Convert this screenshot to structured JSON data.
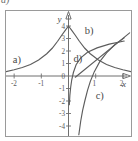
{
  "figure": {
    "corner_tag": "d)",
    "axis_labels": {
      "x": "x",
      "y": "y"
    },
    "x_ticks": [
      {
        "value": -2,
        "label": "-2"
      },
      {
        "value": -1,
        "label": "-1"
      },
      {
        "value": 1,
        "label": "1"
      },
      {
        "value": 2,
        "label": "2"
      }
    ],
    "y_ticks": [
      {
        "value": 4,
        "label": "4"
      },
      {
        "value": 3,
        "label": "3"
      },
      {
        "value": 2,
        "label": "2"
      },
      {
        "value": 1,
        "label": "1"
      },
      {
        "value": 0,
        "label": "0"
      },
      {
        "value": -1,
        "label": "-1"
      },
      {
        "value": -2,
        "label": "-2"
      },
      {
        "value": -3,
        "label": "-3"
      },
      {
        "value": -4,
        "label": "-4"
      }
    ],
    "curve_labels": [
      {
        "id": "a",
        "text": "a)"
      },
      {
        "id": "b",
        "text": "b)"
      },
      {
        "id": "c",
        "text": "c)"
      },
      {
        "id": "d",
        "text": "d)"
      }
    ]
  },
  "chart_data": {
    "type": "line",
    "title": "",
    "xlabel": "x",
    "ylabel": "y",
    "xlim": [
      -2.3,
      2.3
    ],
    "ylim": [
      -4.8,
      5.2
    ],
    "grid": false,
    "legend": "inline-labels",
    "series": [
      {
        "name": "a)",
        "label": "a)",
        "description": "increasing exponential approaching y=4 at x=0 from the left",
        "x": [
          -2.3,
          -2.0,
          -1.7,
          -1.4,
          -1.1,
          -0.8,
          -0.6,
          -0.4,
          -0.25,
          -0.12,
          0.0
        ],
        "y": [
          0.35,
          0.5,
          0.68,
          0.92,
          1.28,
          1.78,
          2.22,
          2.78,
          3.26,
          3.65,
          4.0
        ]
      },
      {
        "name": "b)",
        "label": "b)",
        "description": "decreasing exponential from y=4 at x=0 toward the right",
        "x": [
          0.0,
          0.12,
          0.25,
          0.4,
          0.6,
          0.8,
          1.1,
          1.4,
          1.7,
          2.0,
          2.3
        ],
        "y": [
          4.0,
          3.65,
          3.26,
          2.78,
          2.22,
          1.78,
          1.28,
          0.92,
          0.68,
          0.5,
          0.35
        ]
      },
      {
        "name": "c)",
        "label": "c)",
        "description": "logarithm-type curve rising steeply, crossing x-axis near x=0.8",
        "x": [
          0.38,
          0.45,
          0.52,
          0.6,
          0.7,
          0.8,
          0.95,
          1.15,
          1.4,
          1.7,
          2.05
        ],
        "y": [
          -4.7,
          -3.6,
          -2.75,
          -2.0,
          -1.15,
          -0.45,
          0.35,
          1.15,
          1.85,
          2.5,
          3.05
        ]
      },
      {
        "name": "d)",
        "label": "d)",
        "description": "logarithm-type curve close to the y-axis, crossing x-axis near x=0.1",
        "x": [
          0.03,
          0.05,
          0.08,
          0.12,
          0.18,
          0.28,
          0.45,
          0.7,
          1.05,
          1.5,
          2.05
        ],
        "y": [
          -2.3,
          -1.55,
          -0.9,
          -0.3,
          0.28,
          0.9,
          1.45,
          1.9,
          2.25,
          2.55,
          2.8
        ]
      },
      {
        "name": "line",
        "label": "",
        "description": "straight line rising to the right through roughly (0.3,0) and (2.2,3.4)",
        "x": [
          0.25,
          2.25
        ],
        "y": [
          -0.1,
          3.45
        ]
      }
    ]
  }
}
